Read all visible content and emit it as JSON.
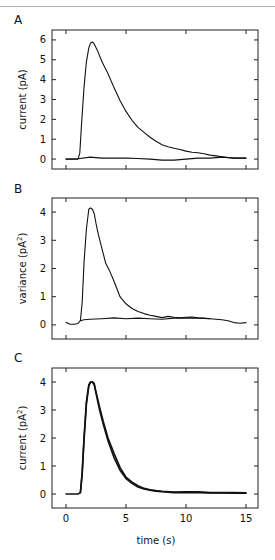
{
  "figure": {
    "x_label": "time (s)",
    "x_unit": "s"
  },
  "chart_data": [
    {
      "type": "line",
      "panel": "A",
      "title": "",
      "xlabel": "",
      "ylabel": "current (pA)",
      "xlim": [
        -2.3,
        15.8
      ],
      "ylim": [
        -0.5,
        6.5
      ],
      "xticks": [
        0,
        5,
        10,
        15
      ],
      "xtick_labels_shown": false,
      "yticks": [
        0,
        1,
        2,
        3,
        4,
        5,
        6
      ],
      "ytick_labels": [
        "0",
        "1",
        "2",
        "3",
        "4",
        "5",
        "6"
      ],
      "grid": false,
      "series": [
        {
          "name": "mean current",
          "x": [
            0,
            0.5,
            1.0,
            1.15,
            1.3,
            1.5,
            1.7,
            1.9,
            2.05,
            2.2,
            2.35,
            2.6,
            3.0,
            3.5,
            4.0,
            4.5,
            5.0,
            5.5,
            6.0,
            6.5,
            7.0,
            7.5,
            8.0,
            8.5,
            9.0,
            9.5,
            10.0,
            10.5,
            11.0,
            11.5,
            12.0,
            12.5,
            13.0,
            13.5,
            14.0,
            14.5,
            15.0
          ],
          "y": [
            0.0,
            0.0,
            0.0,
            0.3,
            1.8,
            3.6,
            4.9,
            5.6,
            5.85,
            5.9,
            5.8,
            5.5,
            4.9,
            4.3,
            3.6,
            2.95,
            2.4,
            1.95,
            1.6,
            1.35,
            1.1,
            0.9,
            0.72,
            0.62,
            0.55,
            0.48,
            0.4,
            0.34,
            0.32,
            0.27,
            0.2,
            0.16,
            0.12,
            0.08,
            0.05,
            0.05,
            0.05
          ]
        },
        {
          "name": "baseline current",
          "x": [
            0,
            1.0,
            2.0,
            3.0,
            4.0,
            5.0,
            6.0,
            7.0,
            8.0,
            9.0,
            10.0,
            11.0,
            12.0,
            13.0,
            14.0,
            15.0
          ],
          "y": [
            0.0,
            0.02,
            0.1,
            0.05,
            0.05,
            0.05,
            0.03,
            0.0,
            -0.05,
            -0.05,
            0.0,
            0.05,
            0.05,
            0.1,
            0.05,
            0.05
          ]
        }
      ]
    },
    {
      "type": "line",
      "panel": "B",
      "title": "",
      "xlabel": "",
      "ylabel": "variance (pA²)",
      "ylabel_text": "variance (pA",
      "ylabel_sup": "2",
      "ylabel_close": ")",
      "xlim": [
        -2.3,
        15.8
      ],
      "ylim": [
        -0.5,
        4.5
      ],
      "xticks": [
        0,
        5,
        10,
        15
      ],
      "xtick_labels_shown": false,
      "yticks": [
        0,
        1,
        2,
        3,
        4
      ],
      "ytick_labels": [
        "0",
        "1",
        "2",
        "3",
        "4"
      ],
      "grid": false,
      "series": [
        {
          "name": "variance",
          "x": [
            0,
            0.3,
            0.7,
            1.0,
            1.2,
            1.35,
            1.5,
            1.7,
            1.9,
            2.05,
            2.2,
            2.35,
            2.5,
            2.7,
            3.0,
            3.3,
            3.6,
            4.0,
            4.5,
            5.0,
            5.5,
            6.0,
            6.5,
            7.0,
            7.5,
            8.0,
            8.5,
            9.0,
            9.5,
            10.0,
            10.5,
            11.0,
            11.5,
            12.0,
            12.5,
            13.0,
            13.5,
            14.0,
            14.5,
            15.0
          ],
          "y": [
            0.08,
            0.03,
            0.02,
            0.05,
            0.15,
            0.8,
            2.2,
            3.4,
            4.1,
            4.15,
            4.1,
            3.95,
            3.6,
            3.2,
            2.7,
            2.2,
            1.95,
            1.55,
            1.0,
            0.75,
            0.58,
            0.48,
            0.4,
            0.34,
            0.3,
            0.26,
            0.3,
            0.27,
            0.25,
            0.27,
            0.28,
            0.25,
            0.24,
            0.22,
            0.2,
            0.18,
            0.15,
            0.08,
            0.06,
            0.08
          ]
        },
        {
          "name": "baseline variance",
          "x": [
            1.2,
            1.5,
            2.0,
            3.0,
            4.0,
            5.0,
            6.0,
            7.0,
            8.0,
            9.0,
            10.0,
            11.0,
            12.0
          ],
          "y": [
            0.15,
            0.18,
            0.2,
            0.22,
            0.25,
            0.22,
            0.24,
            0.22,
            0.2,
            0.24,
            0.25,
            0.24,
            0.22
          ]
        }
      ]
    },
    {
      "type": "line",
      "panel": "C",
      "title": "",
      "xlabel": "time (s)",
      "ylabel": "current (pA²)",
      "ylabel_text": "current (pA",
      "ylabel_sup": "2",
      "ylabel_close": ")",
      "xlim": [
        -2.3,
        15.8
      ],
      "ylim": [
        -0.5,
        4.5
      ],
      "xticks": [
        0,
        5,
        10,
        15
      ],
      "xtick_labels": [
        "0",
        "5",
        "10",
        "15"
      ],
      "xtick_labels_shown": true,
      "yticks": [
        0,
        1,
        2,
        3,
        4
      ],
      "ytick_labels": [
        "0",
        "1",
        "2",
        "3",
        "4"
      ],
      "grid": false,
      "series": [
        {
          "name": "scaled current",
          "x": [
            0,
            0.5,
            1.0,
            1.2,
            1.35,
            1.5,
            1.7,
            1.9,
            2.05,
            2.2,
            2.35,
            2.5,
            2.8,
            3.1,
            3.5,
            4.0,
            4.5,
            5.0,
            5.5,
            6.0,
            6.5,
            7.0,
            7.5,
            8.0,
            8.5,
            9.0,
            10.0,
            11.0,
            12.0,
            13.0,
            14.0,
            15.0
          ],
          "y": [
            0.0,
            0.0,
            0.0,
            0.05,
            0.8,
            2.0,
            3.3,
            3.9,
            4.0,
            4.0,
            3.9,
            3.6,
            3.0,
            2.5,
            1.9,
            1.3,
            0.85,
            0.55,
            0.38,
            0.25,
            0.18,
            0.14,
            0.1,
            0.08,
            0.06,
            0.05,
            0.05,
            0.05,
            0.04,
            0.04,
            0.03,
            0.03
          ]
        },
        {
          "name": "variance (overlay)",
          "x": [
            1.2,
            1.35,
            1.5,
            1.7,
            1.9,
            2.05,
            2.2,
            2.35,
            2.5,
            2.8,
            3.1,
            3.5,
            4.0,
            4.5,
            5.0,
            5.5,
            6.0,
            6.5,
            7.0,
            7.5,
            8.0,
            9.0,
            10.0,
            11.0,
            12.0,
            13.0,
            14.0,
            15.0
          ],
          "y": [
            0.05,
            0.7,
            1.9,
            3.2,
            3.85,
            4.0,
            4.0,
            3.95,
            3.65,
            3.1,
            2.6,
            2.0,
            1.45,
            0.95,
            0.6,
            0.42,
            0.3,
            0.2,
            0.15,
            0.12,
            0.1,
            0.07,
            0.08,
            0.08,
            0.05,
            0.05,
            0.05,
            0.04
          ]
        }
      ]
    }
  ]
}
